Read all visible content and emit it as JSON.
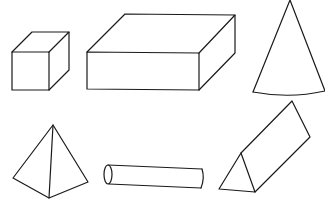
{
  "diagram": {
    "title": "",
    "background": "#ffffff",
    "stroke_color": "#1a1a1a",
    "stroke_width": 1.2,
    "shapes": [
      {
        "name": "cube",
        "label": "Cube",
        "paths": [
          "M12,52 L49,52 L49,90 L12,90 Z",
          "M12,52 L32,32 L69,32 L49,52",
          "M69,32 L69,70 L49,90"
        ]
      },
      {
        "name": "rectangular-prism",
        "label": "Rectangular prism",
        "paths": [
          "M87,52 L199,53 L199,90 L87,89 Z",
          "M87,52 L125,14 L235,15 L199,53",
          "M235,15 L235,53 L199,90"
        ]
      },
      {
        "name": "cone",
        "label": "Cone",
        "paths": [
          "M253,92 L290,0 L325,91",
          "M253,92 Q290,99 325,91"
        ]
      },
      {
        "name": "pyramid",
        "label": "Pyramid",
        "paths": [
          "M53,125 L13,178 L49,198 L88,182 Z",
          "M53,125 L49,198"
        ]
      },
      {
        "name": "cylinder",
        "label": "Cylinder",
        "paths": [
          "M108,165 L202,169",
          "M109,184 L201,188",
          "M202,169 Q205,178 201,188"
        ],
        "ellipse": {
          "cx": 108,
          "cy": 174.5,
          "rx": 4,
          "ry": 9.5
        }
      },
      {
        "name": "triangular-prism",
        "label": "Triangular prism",
        "paths": [
          "M219,189 L241,153 L255,192 Z",
          "M241,153 L292,101 L310,137 L255,192"
        ]
      }
    ]
  }
}
